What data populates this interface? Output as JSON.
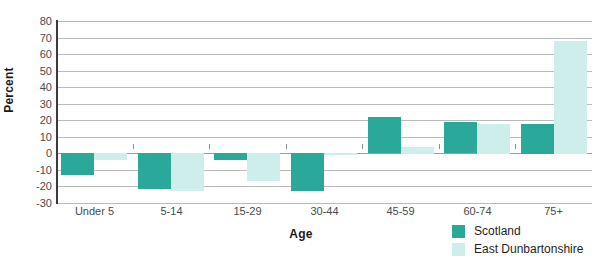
{
  "chart_data": {
    "type": "bar",
    "title": "",
    "xlabel": "Age",
    "ylabel": "Percent",
    "categories": [
      "Under 5",
      "5-14",
      "15-29",
      "30-44",
      "45-59",
      "60-74",
      "75+"
    ],
    "series": [
      {
        "name": "Scotland",
        "color": "#2aa89a",
        "values": [
          -13,
          -22,
          -4,
          -23,
          22,
          19,
          18
        ]
      },
      {
        "name": "East Dunbartonshire",
        "color": "#cdeeea",
        "values": [
          -4,
          -23,
          -17,
          -1,
          4,
          18,
          68
        ]
      }
    ],
    "ylim": [
      -30,
      80
    ],
    "ytick_step": 10,
    "yticks": [
      80,
      70,
      60,
      50,
      40,
      30,
      20,
      10,
      0,
      -10,
      -20,
      -30
    ],
    "ytick_labels": [
      "80",
      "70",
      "60",
      "50",
      "40",
      "30",
      "20",
      "10",
      "0",
      "-10",
      "-20",
      "-30"
    ],
    "grid": true,
    "grid_axis": "y",
    "legend_position": "bottom-right",
    "zero_line": 0
  },
  "legend": {
    "entries": [
      {
        "label": "Scotland",
        "key": "scotland"
      },
      {
        "label": "East Dunbartonshire",
        "key": "east-dunbartonshire"
      }
    ]
  },
  "colors": {
    "scotland": "#2aa89a",
    "east_dunbartonshire": "#cdeeea",
    "gridline": "#b9bcbd",
    "axis": "#3b3b3b",
    "text": "#4a4a4a",
    "background": "#ffffff"
  }
}
